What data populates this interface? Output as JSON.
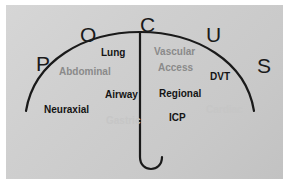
{
  "diagram": {
    "background_color": "#cfcfcf",
    "page_color": "#ffffff",
    "stroke_color": "#1a1a1a",
    "acronym": [
      {
        "letter": "P",
        "x": 30,
        "y": 48,
        "size": 21
      },
      {
        "letter": "O",
        "x": 74,
        "y": 19,
        "size": 21
      },
      {
        "letter": "C",
        "x": 134,
        "y": 9,
        "size": 21
      },
      {
        "letter": "U",
        "x": 200,
        "y": 19,
        "size": 21
      },
      {
        "letter": "S",
        "x": 251,
        "y": 50,
        "size": 21
      }
    ],
    "labels": [
      {
        "text": "Lung",
        "x": 95,
        "y": 43,
        "size": 10,
        "shade": "lbl-dark",
        "name": "label-lung"
      },
      {
        "text": "Vascular",
        "x": 148,
        "y": 42,
        "size": 10,
        "shade": "lbl-gray",
        "name": "label-vascular"
      },
      {
        "text": "Access",
        "x": 152,
        "y": 58,
        "size": 10,
        "shade": "lbl-gray",
        "name": "label-access"
      },
      {
        "text": "Abdominal",
        "x": 53,
        "y": 62,
        "size": 10,
        "shade": "lbl-gray",
        "name": "label-abdominal"
      },
      {
        "text": "DVT",
        "x": 204,
        "y": 67,
        "size": 10,
        "shade": "lbl-dark",
        "name": "label-dvt"
      },
      {
        "text": "Airway",
        "x": 99,
        "y": 85,
        "size": 10,
        "shade": "lbl-dark",
        "name": "label-airway"
      },
      {
        "text": "Regional",
        "x": 153,
        "y": 84,
        "size": 10,
        "shade": "lbl-dark",
        "name": "label-regional"
      },
      {
        "text": "Neuraxial",
        "x": 38,
        "y": 100,
        "size": 10,
        "shade": "lbl-dark",
        "name": "label-neuraxial"
      },
      {
        "text": "Cardiac",
        "x": 200,
        "y": 100,
        "size": 10,
        "shade": "lbl-faint",
        "name": "label-cardiac"
      },
      {
        "text": "Gastric",
        "x": 100,
        "y": 111,
        "size": 10,
        "shade": "lbl-faint",
        "name": "label-gastric"
      },
      {
        "text": "ICP",
        "x": 163,
        "y": 108,
        "size": 10,
        "shade": "lbl-dark",
        "name": "label-icp"
      }
    ]
  }
}
